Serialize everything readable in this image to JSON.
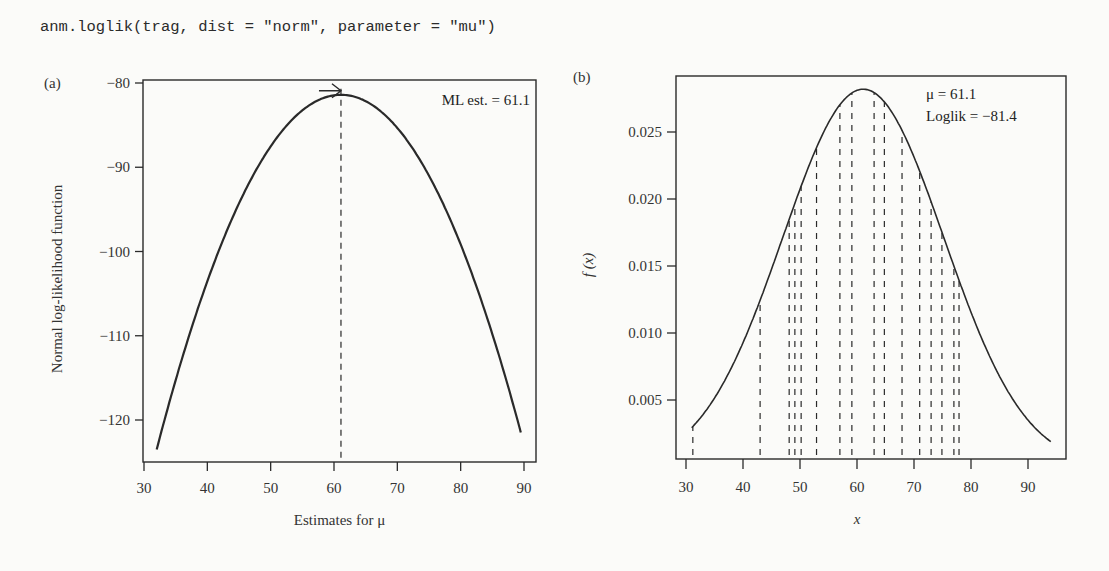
{
  "code_line": "anm.loglik(trag, dist = \"norm\", parameter = \"mu\")",
  "chart_data": [
    {
      "panel": "(a)",
      "type": "line",
      "title": "",
      "xlabel": "Estimates for μ",
      "ylabel": "Normal log-likelihood function",
      "xlim": [
        30,
        92
      ],
      "ylim": [
        -125,
        -80
      ],
      "xticks": [
        30,
        40,
        50,
        60,
        70,
        80,
        90
      ],
      "yticks": [
        -80,
        -90,
        -100,
        -110,
        -120
      ],
      "ytick_labels": [
        "−80",
        "−90",
        "−100",
        "−110",
        "−120"
      ],
      "grid": false,
      "curve": {
        "description": "quadratic log-likelihood for normal mean",
        "peak_x": 61.1,
        "peak_y": -81.4,
        "x_range": [
          32,
          89.5
        ],
        "x": [
          32,
          35,
          40,
          45,
          50,
          55,
          61.1,
          65,
          70,
          75,
          80,
          85,
          89.5
        ],
        "y": [
          -123.5,
          -115.3,
          -103.5,
          -94.3,
          -87.5,
          -83.3,
          -81.4,
          -82.2,
          -85.3,
          -91.0,
          -99.2,
          -109.8,
          -121.5
        ]
      },
      "vline": {
        "x": 61.1,
        "style": "dashed"
      },
      "arrow": {
        "x": 61.1,
        "y": -81.4
      },
      "annotation": "ML est. = 61.1"
    },
    {
      "panel": "(b)",
      "type": "line",
      "title": "",
      "xlabel": "x",
      "ylabel": "f(x)",
      "xlim": [
        28,
        96
      ],
      "ylim": [
        0,
        0.0295
      ],
      "xticks": [
        30,
        40,
        50,
        60,
        70,
        80,
        90
      ],
      "yticks": [
        0.005,
        0.01,
        0.015,
        0.02,
        0.025
      ],
      "ytick_labels": [
        "0.005",
        "0.010",
        "0.015",
        "0.020",
        "0.025"
      ],
      "grid": false,
      "curve": {
        "description": "normal density fitted to data",
        "mean": 61.1,
        "sd": 14.15,
        "x_range": [
          31,
          94
        ]
      },
      "observations": [
        31.2,
        43.0,
        48.1,
        49.1,
        50.2,
        52.9,
        57.0,
        59.1,
        63.0,
        64.8,
        67.9,
        71.0,
        73.0,
        74.9,
        77.0,
        77.9
      ],
      "observation_style": "dashed vertical lines from x-axis to density curve",
      "annotations": [
        "μ = 61.1",
        "Loglik = −81.4"
      ]
    }
  ],
  "panels": {
    "a": {
      "label": "(a)",
      "annotation": "ML est. = 61.1",
      "xlabel": "Estimates for μ",
      "ylabel": "Normal log-likelihood function"
    },
    "b": {
      "label": "(b)",
      "annotation_mu": "μ = 61.1",
      "annotation_loglik": "Loglik = −81.4",
      "xlabel": "x",
      "ylabel": "f (x)"
    }
  },
  "colors": {
    "ink": "#2a2a2a",
    "background": "#fbfbf9"
  }
}
